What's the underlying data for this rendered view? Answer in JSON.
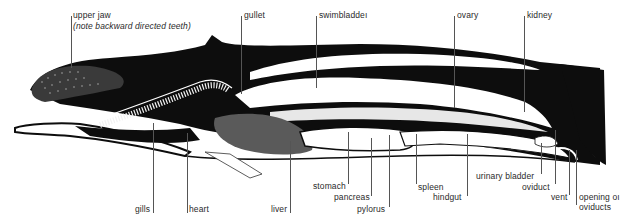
{
  "figure": {
    "colors": {
      "ink": "#0d0d0d",
      "paper": "#ffffff",
      "label_text": "#2a2a2a",
      "leader_line": "#555555"
    }
  },
  "labels": {
    "top": [
      {
        "id": "upper-jaw",
        "text": "upper jaw",
        "x": 73,
        "y": 13
      },
      {
        "id": "upper-jaw-note",
        "text": "(note backward directed teeth)",
        "x": 73,
        "y": 23
      },
      {
        "id": "gullet",
        "text": "gullet",
        "x": 244,
        "y": 13
      },
      {
        "id": "swimbladder",
        "text": "swimbladdeı",
        "x": 318,
        "y": 13
      },
      {
        "id": "ovary",
        "text": "ovary",
        "x": 456,
        "y": 13
      },
      {
        "id": "kidney",
        "text": "kidney",
        "x": 526,
        "y": 13
      }
    ],
    "bottom": [
      {
        "id": "gills",
        "text": "gills",
        "x": 136,
        "y": 205
      },
      {
        "id": "heart",
        "text": "heart",
        "x": 189,
        "y": 205
      },
      {
        "id": "liver",
        "text": "liver",
        "x": 272,
        "y": 205
      },
      {
        "id": "stomach",
        "text": "stomach",
        "x": 313,
        "y": 182
      },
      {
        "id": "pancreas",
        "text": "pancreas",
        "x": 334,
        "y": 193
      },
      {
        "id": "pylorus",
        "text": "pylorus",
        "x": 357,
        "y": 205
      },
      {
        "id": "spleen",
        "text": "spleen",
        "x": 418,
        "y": 183
      },
      {
        "id": "hindgut",
        "text": "hindgut",
        "x": 433,
        "y": 193
      },
      {
        "id": "urinary-bladder",
        "text": "urinary bladder",
        "x": 476,
        "y": 172
      },
      {
        "id": "oviduct",
        "text": "oviduct",
        "x": 522,
        "y": 183
      },
      {
        "id": "vent",
        "text": "vent",
        "x": 551,
        "y": 193
      },
      {
        "id": "opening-of-oviducts-1",
        "text": "opening oı",
        "x": 579,
        "y": 193
      },
      {
        "id": "opening-of-oviducts-2",
        "text": "oviducts",
        "x": 579,
        "y": 203
      }
    ]
  }
}
